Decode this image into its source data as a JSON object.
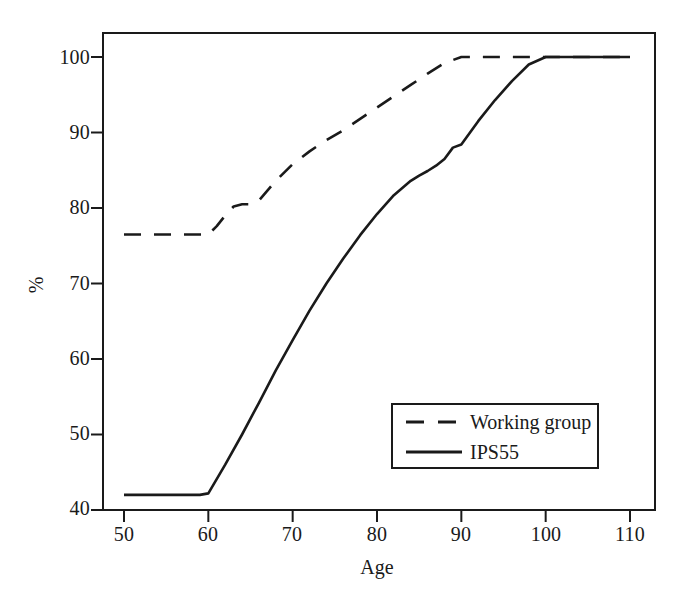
{
  "chart_data": {
    "type": "line",
    "title": "",
    "subtitle": "",
    "xlabel": "Age",
    "ylabel": "%",
    "xlim": [
      50,
      110
    ],
    "ylim": [
      40,
      102
    ],
    "xticks": [
      50,
      60,
      70,
      80,
      90,
      100,
      110
    ],
    "yticks": [
      40,
      50,
      60,
      70,
      80,
      90,
      100
    ],
    "xtick_labels": [
      "50",
      "60",
      "70",
      "80",
      "90",
      "100",
      "110"
    ],
    "ytick_labels": [
      "40",
      "50",
      "60",
      "70",
      "80",
      "90",
      "100"
    ],
    "grid": false,
    "legend_position": "lower right",
    "frame": true,
    "series": [
      {
        "name": "Working group",
        "style": "dashed",
        "color": "#1a1a1a",
        "x": [
          50,
          55,
          59,
          60,
          61,
          62,
          63,
          64,
          65,
          66,
          67,
          68,
          70,
          72,
          74,
          76,
          78,
          80,
          82,
          84,
          86,
          88,
          90,
          95,
          100,
          105,
          110
        ],
        "y": [
          76.5,
          76.5,
          76.5,
          76.5,
          77.6,
          79.0,
          80.2,
          80.5,
          80.5,
          81.0,
          82.3,
          83.6,
          85.8,
          87.5,
          89.0,
          90.3,
          91.8,
          93.3,
          94.8,
          96.3,
          97.8,
          99.2,
          100.0,
          100.0,
          100.0,
          100.0,
          100.0
        ]
      },
      {
        "name": "IPS55",
        "style": "solid",
        "color": "#1a1a1a",
        "x": [
          50,
          54,
          58,
          59,
          60,
          62,
          64,
          66,
          68,
          70,
          72,
          74,
          76,
          78,
          80,
          82,
          84,
          85,
          86,
          87,
          88,
          89,
          90,
          92,
          94,
          96,
          98,
          100,
          104,
          110
        ],
        "y": [
          42.0,
          42.0,
          42.0,
          42.0,
          42.2,
          46.0,
          50.0,
          54.2,
          58.5,
          62.5,
          66.4,
          70.0,
          73.3,
          76.4,
          79.2,
          81.7,
          83.6,
          84.3,
          84.9,
          85.6,
          86.5,
          88.0,
          88.4,
          91.5,
          94.3,
          96.8,
          99.0,
          100.0,
          100.0,
          100.0
        ]
      }
    ],
    "legend_entries": [
      {
        "label": "Working group",
        "style": "dashed"
      },
      {
        "label": "IPS55",
        "style": "solid"
      }
    ]
  }
}
